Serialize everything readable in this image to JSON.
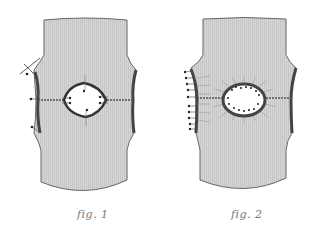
{
  "figures": [
    {
      "id": "fig1",
      "caption": "fig. 1",
      "description": "Knitted garment piece with horizontal seam and diamond-shaped opening, side seams marked with pins"
    },
    {
      "id": "fig2",
      "caption": "fig. 2",
      "description": "Knitted garment piece with oval opening bordered by pin stitches and radiating lines, left side seam pinned"
    }
  ],
  "colors": {
    "fabric": "#d4d4d4",
    "fabric_rib": "#c4c4c4",
    "outline": "#555555",
    "seam": "#444444",
    "hole": "#ffffff",
    "caption": "#777777"
  }
}
